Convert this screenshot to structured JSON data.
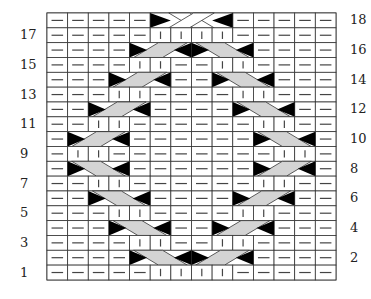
{
  "chart_title": "",
  "grid": {
    "columns": 14,
    "rows": 18,
    "left": 47,
    "top": 13,
    "cell_width": 20.64,
    "cell_height": 14.83
  },
  "colors": {
    "grid_line": "#333333",
    "cable_fill": "#d4d4d4",
    "cable_point": "#000000",
    "symbol": "#444444",
    "background": "#ffffff"
  },
  "legend_symbols": {
    "P": "purl (horizontal dash)",
    "K": "knit (vertical bar)",
    "CL": "2/1 cable, left-leaning start",
    "CR": "2/1 cable, right-leaning end",
    "X4": "2/2 cable cross"
  },
  "row_labels": {
    "left": [
      17,
      15,
      13,
      11,
      9,
      7,
      5,
      3,
      1
    ],
    "right": [
      18,
      16,
      14,
      12,
      10,
      8,
      6,
      4,
      2
    ]
  },
  "rows": [
    {
      "row": 18,
      "cells": "PPPPP____PPPPP",
      "cables": [
        {
          "start": 6,
          "width": 4,
          "type": "cross"
        }
      ]
    },
    {
      "row": 17,
      "cells": "PPPPPKKKKPPPPP",
      "cables": []
    },
    {
      "row": 16,
      "cells": "PPPP______PPPP",
      "cables": [
        {
          "start": 5,
          "width": 3,
          "type": "out-left"
        },
        {
          "start": 8,
          "width": 3,
          "type": "out-right"
        }
      ]
    },
    {
      "row": 15,
      "cells": "PPPPKKPPKKPPPP",
      "cables": []
    },
    {
      "row": 14,
      "cells": "PPP___PP___PPP",
      "cables": [
        {
          "start": 4,
          "width": 3,
          "type": "out-left"
        },
        {
          "start": 9,
          "width": 3,
          "type": "out-right"
        }
      ]
    },
    {
      "row": 13,
      "cells": "PPPKKPPPPKKPPP",
      "cables": []
    },
    {
      "row": 12,
      "cells": "PP___PPPP___PP",
      "cables": [
        {
          "start": 3,
          "width": 3,
          "type": "out-left"
        },
        {
          "start": 10,
          "width": 3,
          "type": "out-right"
        }
      ]
    },
    {
      "row": 11,
      "cells": "PPKKPPPPPPKKPP",
      "cables": []
    },
    {
      "row": 10,
      "cells": "P___PPPPPP___P",
      "cables": [
        {
          "start": 2,
          "width": 3,
          "type": "out-left"
        },
        {
          "start": 11,
          "width": 3,
          "type": "out-right"
        }
      ]
    },
    {
      "row": 9,
      "cells": "PKKPPPPPPPPKKP",
      "cables": []
    },
    {
      "row": 8,
      "cells": "P___PPPPPP___P",
      "cables": [
        {
          "start": 2,
          "width": 3,
          "type": "in-right"
        },
        {
          "start": 11,
          "width": 3,
          "type": "in-left"
        }
      ]
    },
    {
      "row": 7,
      "cells": "PPKKPPPPPPKKPP",
      "cables": []
    },
    {
      "row": 6,
      "cells": "PP___PPPP___PP",
      "cables": [
        {
          "start": 3,
          "width": 3,
          "type": "in-right"
        },
        {
          "start": 10,
          "width": 3,
          "type": "in-left"
        }
      ]
    },
    {
      "row": 5,
      "cells": "PPPKKPPPPKKPPP",
      "cables": []
    },
    {
      "row": 4,
      "cells": "PPP___PP___PPP",
      "cables": [
        {
          "start": 4,
          "width": 3,
          "type": "in-right"
        },
        {
          "start": 9,
          "width": 3,
          "type": "in-left"
        }
      ]
    },
    {
      "row": 3,
      "cells": "PPPPKKPPKKPPPP",
      "cables": []
    },
    {
      "row": 2,
      "cells": "PPPP______PPPP",
      "cables": [
        {
          "start": 5,
          "width": 3,
          "type": "in-right"
        },
        {
          "start": 8,
          "width": 3,
          "type": "in-left"
        }
      ]
    },
    {
      "row": 1,
      "cells": "PPPPPKKKKPPPPP",
      "cables": []
    }
  ]
}
